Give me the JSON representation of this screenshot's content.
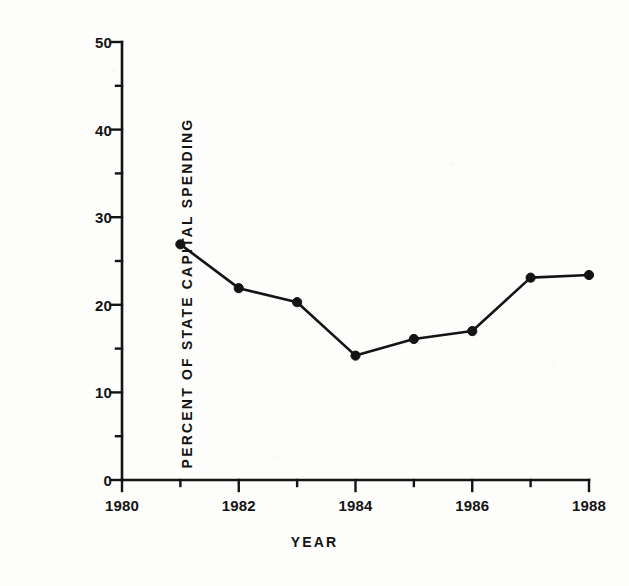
{
  "chart_data": {
    "type": "line",
    "title": "",
    "xlabel": "YEAR",
    "ylabel": "PERCENT OF STATE CAPITAL SPENDING",
    "x": [
      1981,
      1982,
      1983,
      1984,
      1985,
      1986,
      1987,
      1988
    ],
    "values": [
      26.9,
      21.9,
      20.3,
      14.2,
      16.1,
      17.0,
      23.1,
      23.4
    ],
    "series": [
      {
        "name": "Percent of state capital spending",
        "x": [
          1981,
          1982,
          1983,
          1984,
          1985,
          1986,
          1987,
          1988
        ],
        "values": [
          26.9,
          21.9,
          20.3,
          14.2,
          16.1,
          17.0,
          23.1,
          23.4
        ]
      }
    ],
    "xlim": [
      1980,
      1988
    ],
    "ylim": [
      0,
      50
    ],
    "x_major_ticks": [
      1980,
      1982,
      1984,
      1986,
      1988
    ],
    "x_minor_ticks": [
      1981,
      1983,
      1985,
      1987
    ],
    "x_tick_labels": [
      "1980",
      "1982",
      "1984",
      "1986",
      "1988"
    ],
    "y_major_ticks": [
      0,
      10,
      20,
      30,
      40,
      50
    ],
    "y_minor_ticks": [
      5,
      15,
      25,
      35,
      45
    ],
    "y_tick_labels": [
      "0",
      "10",
      "20",
      "30",
      "40",
      "50"
    ],
    "grid": false,
    "legend": null,
    "marker": "filled-circle",
    "line_color": "#141414",
    "marker_color": "#141414",
    "background_color": "#fdfdfb",
    "axis_color": "#141414"
  },
  "figure": {
    "y_axis_title": "PERCENT OF STATE CAPITAL SPENDING",
    "x_axis_title": "YEAR"
  }
}
